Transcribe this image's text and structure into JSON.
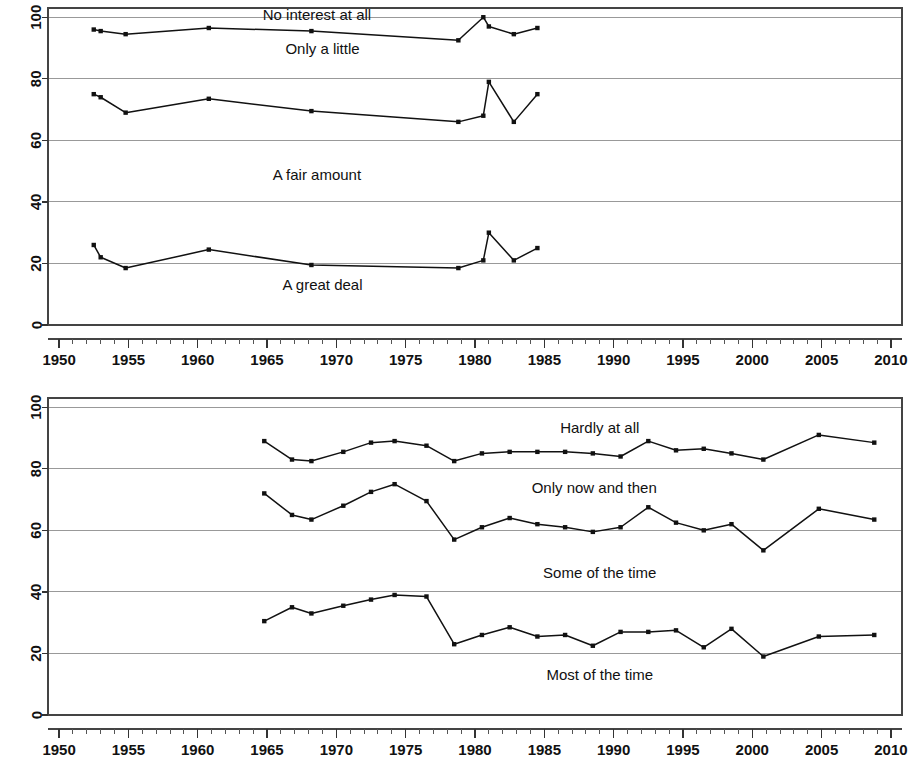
{
  "chart_data": [
    {
      "id": "top",
      "type": "line",
      "title": "",
      "xlabel": "",
      "ylabel": "",
      "xlim": [
        1949.2,
        2010.8
      ],
      "ylim": [
        0,
        103
      ],
      "grid": true,
      "legend_position": "inline-annotations",
      "xticks": [
        1950,
        1955,
        1960,
        1965,
        1970,
        1975,
        1980,
        1985,
        1990,
        1995,
        2000,
        2005,
        2010
      ],
      "xtick_labels": [
        "1950",
        "1955",
        "1960",
        "1965",
        "1970",
        "1975",
        "1980",
        "1985",
        "1990",
        "1995",
        "2000",
        "2005",
        "2010"
      ],
      "yticks": [
        0,
        20,
        40,
        60,
        80,
        100
      ],
      "ytick_labels": [
        "0",
        "20",
        "40",
        "60",
        "80",
        "100"
      ],
      "annotations": [
        {
          "text": "No interest at all",
          "x": 1968.6,
          "y": 99.0
        },
        {
          "text": "Only a little",
          "x": 1969.0,
          "y": 88.0
        },
        {
          "text": "A fair amount",
          "x": 1968.6,
          "y": 47.0
        },
        {
          "text": "A great deal",
          "x": 1969.0,
          "y": 11.5
        }
      ],
      "series": [
        {
          "name": "Cumulative to 'Only a little'",
          "x": [
            1952.5,
            1953.0,
            1954.8,
            1960.8,
            1968.2,
            1978.8,
            1980.6,
            1981.0,
            1982.8,
            1984.5
          ],
          "values": [
            96,
            95.5,
            94.5,
            96.5,
            95.5,
            92.5,
            100,
            97,
            94.5,
            96.5
          ]
        },
        {
          "name": "Cumulative to 'A fair amount'",
          "x": [
            1952.5,
            1953.0,
            1954.8,
            1960.8,
            1968.2,
            1978.8,
            1980.6,
            1981.0,
            1982.8,
            1984.5
          ],
          "values": [
            75,
            74,
            69,
            73.5,
            69.5,
            66,
            68,
            79,
            66,
            75
          ]
        },
        {
          "name": "Cumulative to 'A great deal'",
          "x": [
            1952.5,
            1953.0,
            1954.8,
            1960.8,
            1968.2,
            1978.8,
            1980.6,
            1981.0,
            1982.8,
            1984.5
          ],
          "values": [
            26,
            22,
            18.5,
            24.5,
            19.5,
            18.5,
            21,
            30,
            21,
            25
          ]
        }
      ]
    },
    {
      "id": "bottom",
      "type": "line",
      "title": "",
      "xlabel": "",
      "ylabel": "",
      "xlim": [
        1949.2,
        2010.8
      ],
      "ylim": [
        0,
        103
      ],
      "grid": true,
      "legend_position": "inline-annotations",
      "xticks": [
        1950,
        1955,
        1960,
        1965,
        1970,
        1975,
        1980,
        1985,
        1990,
        1995,
        2000,
        2005,
        2010
      ],
      "xtick_labels": [
        "1950",
        "1955",
        "1960",
        "1965",
        "1970",
        "1975",
        "1980",
        "1985",
        "1990",
        "1995",
        "2000",
        "2005",
        "2010"
      ],
      "yticks": [
        0,
        20,
        40,
        60,
        80,
        100
      ],
      "ytick_labels": [
        "0",
        "20",
        "40",
        "60",
        "80",
        "100"
      ],
      "annotations": [
        {
          "text": "Hardly at all",
          "x": 1989.0,
          "y": 91.5
        },
        {
          "text": "Only now and then",
          "x": 1988.6,
          "y": 72.0
        },
        {
          "text": "Some of the time",
          "x": 1989.0,
          "y": 44.5
        },
        {
          "text": "Most of the time",
          "x": 1989.0,
          "y": 11.5
        }
      ],
      "series": [
        {
          "name": "Cumulative to 'Only now and then'",
          "x": [
            1964.8,
            1966.8,
            1968.2,
            1970.5,
            1972.5,
            1974.2,
            1976.5,
            1978.5,
            1980.5,
            1982.5,
            1984.5,
            1986.5,
            1988.5,
            1990.5,
            1992.5,
            1994.5,
            1996.5,
            1998.5,
            2000.8,
            2004.8,
            2008.8
          ],
          "values": [
            89,
            83,
            82.5,
            85.5,
            88.5,
            89,
            87.5,
            82.5,
            85,
            85.5,
            85.5,
            85.5,
            85,
            84,
            89,
            86,
            86.5,
            85,
            83,
            91,
            88.5
          ]
        },
        {
          "name": "Cumulative to 'Some of the time'",
          "x": [
            1964.8,
            1966.8,
            1968.2,
            1970.5,
            1972.5,
            1974.2,
            1976.5,
            1978.5,
            1980.5,
            1982.5,
            1984.5,
            1986.5,
            1988.5,
            1990.5,
            1992.5,
            1994.5,
            1996.5,
            1998.5,
            2000.8,
            2004.8,
            2008.8
          ],
          "values": [
            72,
            65,
            63.5,
            68,
            72.5,
            75,
            69.5,
            57,
            61,
            64,
            62,
            61,
            59.5,
            61,
            67.5,
            62.5,
            60,
            62,
            53.5,
            67,
            63.5
          ]
        },
        {
          "name": "Cumulative to 'Most of the time'",
          "x": [
            1964.8,
            1966.8,
            1968.2,
            1970.5,
            1972.5,
            1974.2,
            1976.5,
            1978.5,
            1980.5,
            1982.5,
            1984.5,
            1986.5,
            1988.5,
            1990.5,
            1992.5,
            1994.5,
            1996.5,
            1998.5,
            2000.8,
            2004.8,
            2008.8
          ],
          "values": [
            30.5,
            35,
            33,
            35.5,
            37.5,
            39,
            38.5,
            23,
            26,
            28.5,
            25.5,
            26,
            22.5,
            27,
            27,
            27.5,
            22,
            28,
            19,
            25.5,
            26
          ]
        }
      ]
    }
  ],
  "panels": {
    "top": {
      "name": "Top chart panel"
    },
    "bottom": {
      "name": "Bottom chart panel"
    }
  }
}
